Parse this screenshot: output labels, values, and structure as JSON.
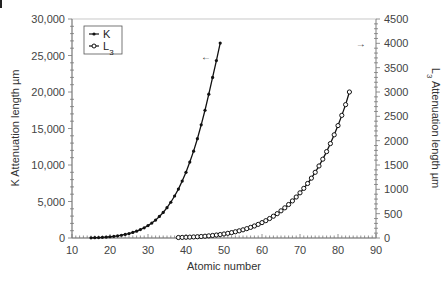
{
  "chart_data": {
    "type": "line",
    "title": "",
    "xlabel": "Atomic number",
    "ylabel": "K Attenuation length µm",
    "y2label": "L3 Attenuation length µm",
    "xlim": [
      10,
      90
    ],
    "ylim": [
      0,
      30000
    ],
    "y2lim": [
      0,
      4500
    ],
    "x_ticks": [
      10,
      20,
      30,
      40,
      50,
      60,
      70,
      80,
      90
    ],
    "y_ticks": [
      "0",
      "5,000",
      "10,000",
      "15,000",
      "20,000",
      "25,000",
      "30,000"
    ],
    "y_tick_values": [
      0,
      5000,
      10000,
      15000,
      20000,
      25000,
      30000
    ],
    "y2_ticks": [
      "0",
      "500",
      "1000",
      "1500",
      "2000",
      "2500",
      "3000",
      "3500",
      "4000",
      "4500"
    ],
    "y2_tick_values": [
      0,
      500,
      1000,
      1500,
      2000,
      2500,
      3000,
      3500,
      4000,
      4500
    ],
    "grid": false,
    "legend_position": "upper-left",
    "annotations": [
      {
        "text": "←",
        "x": 45,
        "y_axis": "left",
        "y": 25000,
        "meaning": "K series uses left axis"
      },
      {
        "text": "→",
        "x": 86,
        "y_axis": "right",
        "y": 4000,
        "meaning": "L3 series uses right axis"
      }
    ],
    "series": [
      {
        "name": "K",
        "legend_label": "K",
        "marker": "filled-circle",
        "axis": "left",
        "x": [
          15,
          16,
          17,
          18,
          19,
          20,
          21,
          22,
          23,
          24,
          25,
          26,
          27,
          28,
          29,
          30,
          31,
          32,
          33,
          34,
          35,
          36,
          37,
          38,
          39,
          40,
          41,
          42,
          43,
          44,
          45,
          46,
          47,
          48,
          49
        ],
        "values": [
          30,
          45,
          65,
          90,
          125,
          170,
          225,
          295,
          380,
          485,
          610,
          760,
          940,
          1150,
          1400,
          1700,
          2050,
          2450,
          2950,
          3500,
          4150,
          4900,
          5750,
          6700,
          7800,
          9000,
          10400,
          11900,
          13600,
          15500,
          17500,
          19700,
          22000,
          24300,
          26700
        ]
      },
      {
        "name": "L3",
        "legend_label": "L3",
        "marker": "open-circle",
        "axis": "right",
        "x": [
          38,
          39,
          40,
          41,
          42,
          43,
          44,
          45,
          46,
          47,
          48,
          49,
          50,
          51,
          52,
          53,
          54,
          55,
          56,
          57,
          58,
          59,
          60,
          61,
          62,
          63,
          64,
          65,
          66,
          67,
          68,
          69,
          70,
          71,
          72,
          73,
          74,
          75,
          76,
          77,
          78,
          79,
          80,
          81,
          82,
          83
        ],
        "values": [
          10,
          12,
          15,
          18,
          22,
          26,
          31,
          37,
          44,
          52,
          61,
          71,
          83,
          96,
          111,
          128,
          147,
          168,
          192,
          218,
          247,
          280,
          316,
          356,
          400,
          448,
          500,
          558,
          620,
          688,
          762,
          842,
          928,
          1020,
          1120,
          1230,
          1350,
          1480,
          1620,
          1775,
          1940,
          2120,
          2310,
          2520,
          2740,
          3000
        ]
      }
    ]
  }
}
